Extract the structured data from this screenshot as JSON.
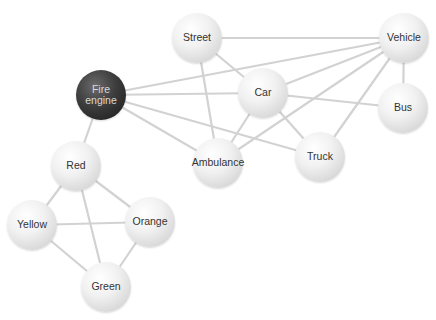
{
  "diagram": {
    "type": "network-graph",
    "nodes": [
      {
        "id": "fire-engine",
        "label": "Fire engine",
        "line1": "Fire",
        "line2": "engine",
        "x": 101,
        "y": 95,
        "r": 25,
        "style": "dark"
      },
      {
        "id": "street",
        "label": "Street",
        "x": 197,
        "y": 38,
        "r": 25
      },
      {
        "id": "vehicle",
        "label": "Vehicle",
        "x": 404,
        "y": 38,
        "r": 25
      },
      {
        "id": "car",
        "label": "Car",
        "x": 263,
        "y": 93,
        "r": 25
      },
      {
        "id": "bus",
        "label": "Bus",
        "x": 403,
        "y": 108,
        "r": 25
      },
      {
        "id": "ambulance",
        "label": "Ambulance",
        "x": 218,
        "y": 163,
        "r": 25
      },
      {
        "id": "truck",
        "label": "Truck",
        "x": 320,
        "y": 157,
        "r": 25
      },
      {
        "id": "red",
        "label": "Red",
        "x": 76,
        "y": 166,
        "r": 25
      },
      {
        "id": "yellow",
        "label": "Yellow",
        "x": 32,
        "y": 225,
        "r": 25
      },
      {
        "id": "orange",
        "label": "Orange",
        "x": 150,
        "y": 222,
        "r": 25
      },
      {
        "id": "green",
        "label": "Green",
        "x": 106,
        "y": 287,
        "r": 25
      }
    ],
    "edges": [
      [
        "fire-engine",
        "vehicle"
      ],
      [
        "fire-engine",
        "car"
      ],
      [
        "fire-engine",
        "truck"
      ],
      [
        "fire-engine",
        "ambulance"
      ],
      [
        "fire-engine",
        "red"
      ],
      [
        "street",
        "vehicle"
      ],
      [
        "street",
        "car"
      ],
      [
        "street",
        "ambulance"
      ],
      [
        "vehicle",
        "car"
      ],
      [
        "vehicle",
        "ambulance"
      ],
      [
        "vehicle",
        "truck"
      ],
      [
        "vehicle",
        "bus"
      ],
      [
        "car",
        "truck"
      ],
      [
        "car",
        "ambulance"
      ],
      [
        "car",
        "bus"
      ],
      [
        "red",
        "yellow"
      ],
      [
        "red",
        "orange"
      ],
      [
        "red",
        "green"
      ],
      [
        "yellow",
        "orange"
      ],
      [
        "yellow",
        "green"
      ],
      [
        "orange",
        "green"
      ]
    ],
    "colors": {
      "edge": "#d2d2d2",
      "node_light": "#e8e8e8",
      "node_dark": "#2e2e2e",
      "text": "#333333"
    }
  }
}
